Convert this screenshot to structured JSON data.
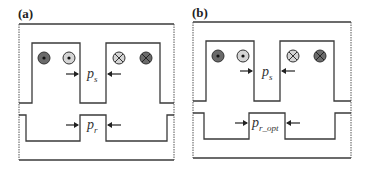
{
  "panels": [
    {
      "label": "(a)",
      "stator_pitch": {
        "symbol": "p",
        "subscript": "s"
      },
      "rotor_pitch": {
        "symbol": "p",
        "subscript": "r"
      },
      "coils": [
        "dot-dark",
        "dot-light",
        "cross-light",
        "cross-dark"
      ]
    },
    {
      "label": "(b)",
      "stator_pitch": {
        "symbol": "p",
        "subscript": "s"
      },
      "rotor_pitch": {
        "symbol": "p",
        "subscript": "r_opt"
      },
      "coils": [
        "dot-dark",
        "dot-light",
        "cross-light",
        "cross-dark"
      ]
    }
  ],
  "colors": {
    "line": "#3a3a3a",
    "coil_dark": "#6a6a6a",
    "coil_light": "#cfcfcf"
  }
}
